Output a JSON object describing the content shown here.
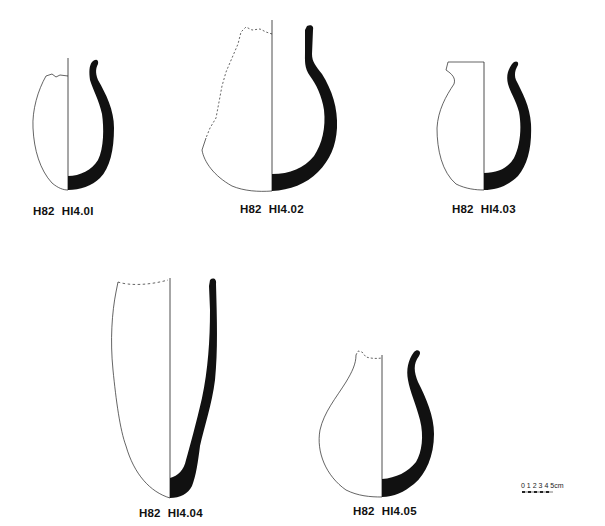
{
  "plate": {
    "background": "#ffffff",
    "ink_color": "#111111",
    "vessels": [
      {
        "id": "v1",
        "feature": "H82",
        "number": "HI4.0I"
      },
      {
        "id": "v2",
        "feature": "H82",
        "number": "HI4.02"
      },
      {
        "id": "v3",
        "feature": "H82",
        "number": "HI4.03"
      },
      {
        "id": "v4",
        "feature": "H82",
        "number": "HI4.04"
      },
      {
        "id": "v5",
        "feature": "H82",
        "number": "HI4.05"
      }
    ],
    "scale_bar": {
      "ticks": [
        "0",
        "1",
        "2",
        "3",
        "4",
        "5"
      ],
      "unit": "cm"
    }
  }
}
